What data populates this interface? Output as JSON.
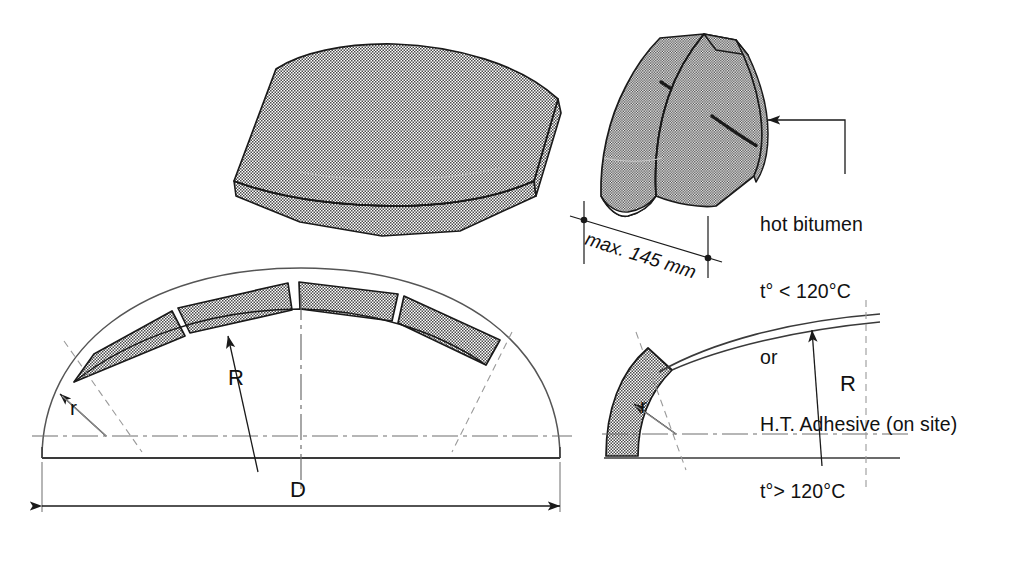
{
  "diagram": {
    "background_color": "#ffffff",
    "line_color": "#1a1a1a",
    "hatch_color": "#8c8c8c",
    "hatch_description": "fine checkerboard stipple halftone approx 50% gray"
  },
  "views": {
    "iso_single_block": {
      "name": "isometric-curved-block",
      "description": "3D isometric view of a single curved stippled precast segment"
    },
    "iso_joint_blocks": {
      "name": "isometric-jointed-blocks",
      "description": "3D isometric view of two curved segments joined at a bitumen joint"
    },
    "section_dome": {
      "name": "dome-cross-section",
      "description": "Cross-section of dome with four voussoir segments on the crown"
    },
    "detail_corner": {
      "name": "corner-detail",
      "description": "Enlarged corner detail of springing with radii r and R"
    }
  },
  "labels": {
    "dimension_145": "max. 145 mm",
    "radius_small_main": "r",
    "radius_large_main": "R",
    "diameter_main": "D",
    "radius_small_detail": "r",
    "radius_large_detail": "R"
  },
  "notes": {
    "lines": [
      "hot bitumen",
      "t° < 120°C",
      "or",
      "H.T. Adhesive (on site)",
      "t°> 120°C"
    ],
    "leader_target": "joint between blocks"
  },
  "icons": {
    "arrowhead": "arrowhead-icon",
    "dimension_dot": "dimension-dot-icon"
  }
}
